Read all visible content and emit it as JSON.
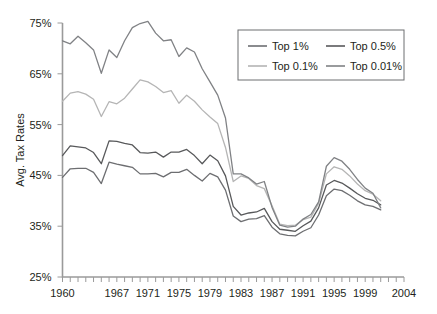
{
  "chart_data": {
    "type": "line",
    "title": "",
    "xlabel": "",
    "ylabel": "Avg. Tax Rates",
    "xlim": [
      1960,
      2004
    ],
    "ylim": [
      25,
      75
    ],
    "grid": false,
    "legend_position": "top-right",
    "y_ticks": [
      "25%",
      "35%",
      "45%",
      "55%",
      "65%",
      "75%"
    ],
    "y_tick_values": [
      25,
      35,
      45,
      55,
      65,
      75
    ],
    "x_ticks": [
      "1960",
      "1967",
      "1971",
      "1975",
      "1979",
      "1983",
      "1987",
      "1991",
      "1995",
      "1999",
      "2004"
    ],
    "x_tick_values": [
      1960,
      1967,
      1971,
      1975,
      1979,
      1983,
      1987,
      1991,
      1995,
      1999,
      2004
    ],
    "x_minor_tick_step": 1,
    "x": [
      1960,
      1961,
      1962,
      1963,
      1964,
      1965,
      1966,
      1967,
      1968,
      1969,
      1970,
      1971,
      1972,
      1973,
      1974,
      1975,
      1976,
      1977,
      1978,
      1979,
      1980,
      1981,
      1982,
      1983,
      1984,
      1985,
      1986,
      1987,
      1988,
      1989,
      1990,
      1991,
      1992,
      1993,
      1994,
      1995,
      1996,
      1997,
      1998,
      1999,
      2000,
      2001
    ],
    "series": [
      {
        "name": "Top 1%",
        "color": "#6d6e71",
        "values": [
          44.6,
          46.3,
          46.4,
          46.4,
          45.6,
          43.4,
          47.6,
          47.2,
          46.9,
          46.6,
          45.3,
          45.3,
          45.4,
          44.7,
          45.6,
          45.6,
          46.2,
          45.0,
          43.9,
          45.4,
          44.7,
          42.1,
          37.0,
          35.9,
          36.4,
          36.5,
          37.1,
          34.8,
          33.5,
          33.2,
          33.1,
          34.0,
          34.7,
          37.2,
          41.0,
          42.3,
          42.0,
          41.1,
          40.0,
          39.2,
          38.9,
          38.2
        ]
      },
      {
        "name": "Top 0.5%",
        "color": "#58595b",
        "values": [
          48.9,
          50.8,
          50.6,
          50.4,
          49.5,
          47.3,
          51.8,
          51.7,
          51.3,
          51.0,
          49.5,
          49.4,
          49.6,
          48.6,
          49.6,
          49.6,
          50.1,
          48.9,
          47.3,
          49.0,
          47.9,
          44.9,
          38.9,
          37.2,
          37.6,
          37.8,
          38.5,
          35.9,
          34.4,
          34.2,
          34.0,
          35.1,
          36.0,
          38.6,
          43.1,
          44.0,
          43.5,
          42.5,
          41.4,
          40.5,
          40.1,
          39.2
        ]
      },
      {
        "name": "Top 0.1%",
        "color": "#b5b5b5",
        "values": [
          59.6,
          61.2,
          61.5,
          61.0,
          60.0,
          56.6,
          59.5,
          59.1,
          60.2,
          62.0,
          63.8,
          63.4,
          62.5,
          61.3,
          61.7,
          59.2,
          60.8,
          59.6,
          57.9,
          56.5,
          55.2,
          50.5,
          43.8,
          44.9,
          44.4,
          43.0,
          42.4,
          39.0,
          35.4,
          35.1,
          35.2,
          36.3,
          36.8,
          39.5,
          45.3,
          46.7,
          46.2,
          44.9,
          43.3,
          42.0,
          41.3,
          40.0
        ]
      },
      {
        "name": "Top 0.01%",
        "color": "#808285",
        "values": [
          71.5,
          70.9,
          72.4,
          71.1,
          69.7,
          65.1,
          69.7,
          68.2,
          71.5,
          74.1,
          74.9,
          75.3,
          73.0,
          71.5,
          71.7,
          68.4,
          70.1,
          69.3,
          66.0,
          63.4,
          60.8,
          56.3,
          45.3,
          45.3,
          44.5,
          43.3,
          43.8,
          38.7,
          35.2,
          34.8,
          35.0,
          36.4,
          37.3,
          39.8,
          46.8,
          48.5,
          47.8,
          46.2,
          44.2,
          42.5,
          41.5,
          38.6
        ]
      }
    ],
    "legend": [
      {
        "label": "Top 1%",
        "color": "#6d6e71"
      },
      {
        "label": "Top 0.5%",
        "color": "#58595b"
      },
      {
        "label": "Top 0.1%",
        "color": "#b5b5b5"
      },
      {
        "label": "Top 0.01%",
        "color": "#808285"
      }
    ]
  }
}
